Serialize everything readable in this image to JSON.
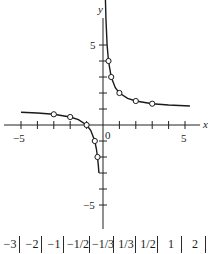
{
  "chart_data": {
    "type": "line",
    "title": "",
    "function": "y = 1 + 1/x",
    "xlabel": "x",
    "ylabel": "y",
    "xlim": [
      -5.9,
      6.6
    ],
    "ylim": [
      -6.5,
      7.5
    ],
    "x_tick_labels": [
      "−5",
      "0",
      "5"
    ],
    "y_tick_labels": [
      "5",
      "−5"
    ],
    "x_ticks": [
      -5,
      -4,
      -3,
      -2,
      -1,
      1,
      2,
      3,
      4,
      5
    ],
    "y_ticks": [
      -5,
      -4,
      -3,
      -2,
      -1,
      1,
      2,
      3,
      4,
      5
    ],
    "grid": false,
    "series": [
      {
        "name": "curve-left",
        "x": [
          -5.0,
          -4.0,
          -3.0,
          -2.0,
          -1.5,
          -1.0,
          -0.75,
          -0.5,
          -0.4,
          -0.333,
          -0.28,
          -0.25
        ],
        "values": [
          0.8,
          0.75,
          0.667,
          0.5,
          0.333,
          0.0,
          -0.333,
          -1.0,
          -1.5,
          -2.0,
          -2.57,
          -3.0
        ]
      },
      {
        "name": "curve-right",
        "x": [
          0.14,
          0.18,
          0.25,
          0.333,
          0.5,
          0.75,
          1.0,
          1.5,
          2.0,
          3.0,
          4.0,
          5.3
        ],
        "values": [
          8.1,
          6.56,
          5.0,
          4.0,
          3.0,
          2.333,
          2.0,
          1.667,
          1.5,
          1.333,
          1.25,
          1.19
        ]
      },
      {
        "name": "marked-points",
        "x": [
          -3,
          -2,
          -1,
          -0.5,
          -0.333,
          0.333,
          0.5,
          1,
          2,
          3
        ],
        "values": [
          0.667,
          0.5,
          0.0,
          -1.0,
          -2.0,
          4.0,
          3.0,
          2.0,
          1.5,
          1.333
        ]
      }
    ]
  },
  "axes": {
    "x_label": "x",
    "y_label": "y",
    "origin_label": "0",
    "x_neg_label": "−5",
    "x_pos_label": "5",
    "y_pos_label": "5",
    "y_neg_label": "−5"
  },
  "table": {
    "cells": [
      "−3",
      "−2",
      "−1",
      "−1/2",
      "−1/3",
      "1/3",
      "1/2",
      "1",
      "2"
    ]
  }
}
